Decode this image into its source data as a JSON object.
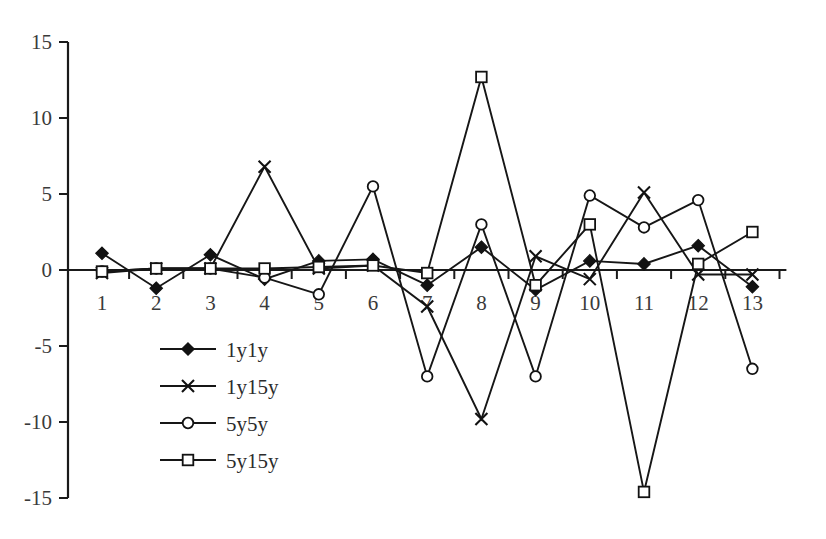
{
  "chart_data": {
    "type": "line",
    "title": "",
    "subtitle": "",
    "xlabel": "",
    "ylabel": "",
    "x": [
      1,
      2,
      3,
      4,
      5,
      6,
      7,
      8,
      9,
      10,
      11,
      12,
      13
    ],
    "categories": [
      "1",
      "2",
      "3",
      "4",
      "5",
      "6",
      "7",
      "8",
      "9",
      "10",
      "11",
      "12",
      "13"
    ],
    "xlim": [
      0.5,
      13.5
    ],
    "ylim": [
      -15,
      15
    ],
    "y_ticks": [
      15,
      10,
      5,
      0,
      -5,
      -10,
      -15
    ],
    "y_tick_labels": [
      "15",
      "10",
      "5",
      "0",
      "-5",
      "-10",
      "-15"
    ],
    "x_ticks": [
      1,
      2,
      3,
      4,
      5,
      6,
      7,
      8,
      9,
      10,
      11,
      12,
      13
    ],
    "x_tick_labels": [
      "1",
      "2",
      "3",
      "4",
      "5",
      "6",
      "7",
      "8",
      "9",
      "10",
      "11",
      "12",
      "13"
    ],
    "grid": false,
    "legend_position": "inside-lower-left",
    "series": [
      {
        "name": "1y1y",
        "marker": "filled-diamond",
        "color": "#121212",
        "values": [
          1.1,
          -1.2,
          1.0,
          -0.6,
          0.6,
          0.7,
          -1.0,
          1.5,
          -1.3,
          0.6,
          0.4,
          1.6,
          -1.1
        ]
      },
      {
        "name": "1y15y",
        "marker": "cross-x",
        "color": "#121212",
        "values": [
          -0.2,
          0.1,
          0.1,
          6.8,
          0.1,
          0.3,
          -2.4,
          -9.8,
          0.9,
          -0.6,
          5.1,
          -0.3,
          -0.3
        ]
      },
      {
        "name": "5y5y",
        "marker": "open-circle",
        "color": "#121212",
        "values": [
          -0.1,
          0.1,
          0.1,
          -0.5,
          -1.6,
          5.5,
          -7.0,
          3.0,
          -7.0,
          4.9,
          2.8,
          4.6,
          -6.5
        ]
      },
      {
        "name": "5y15y",
        "marker": "open-square",
        "color": "#121212",
        "values": [
          -0.1,
          0.1,
          0.1,
          0.1,
          0.2,
          0.3,
          -0.2,
          12.7,
          -1.0,
          3.0,
          -14.6,
          0.4,
          2.5
        ]
      }
    ]
  },
  "legend": {
    "entries": [
      {
        "label": "1y1y",
        "marker": "filled-diamond"
      },
      {
        "label": "1y15y",
        "marker": "cross-x"
      },
      {
        "label": "5y5y",
        "marker": "open-circle"
      },
      {
        "label": "5y15y",
        "marker": "open-square"
      }
    ]
  }
}
